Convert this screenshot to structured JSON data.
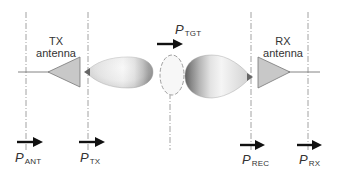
{
  "diagram": {
    "type": "radar-link-power-reference-planes",
    "tx_antenna": {
      "label_line1": "TX",
      "label_line2": "antenna"
    },
    "rx_antenna": {
      "label_line1": "RX",
      "label_line2": "antenna"
    },
    "power_labels": [
      {
        "symbol": "P",
        "sub": "ANT"
      },
      {
        "symbol": "P",
        "sub": "TX"
      },
      {
        "symbol": "P",
        "sub": "TGT"
      },
      {
        "symbol": "P",
        "sub": "REC"
      },
      {
        "symbol": "P",
        "sub": "RX"
      }
    ],
    "colors": {
      "antenna_fill": "#c8c8c8",
      "line": "#777777",
      "arrow": "#111111",
      "target_outline": "#888888"
    }
  }
}
